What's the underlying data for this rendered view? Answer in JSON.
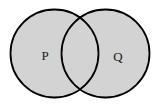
{
  "diagram": {
    "type": "venn",
    "background": "#ffffff",
    "fill_color": "#d3d3d3",
    "stroke_color": "#000000",
    "sets": [
      {
        "label": "P"
      },
      {
        "label": "Q"
      }
    ],
    "shaded_regions": [
      "P only",
      "P and Q",
      "Q only"
    ]
  }
}
